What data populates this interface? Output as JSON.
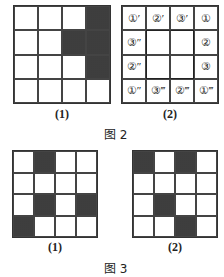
{
  "figure2": {
    "label": "图 2",
    "grid1": {
      "caption": "(1)",
      "rows": 4,
      "cols": 4,
      "shaded": [
        [
          0,
          3
        ],
        [
          1,
          2
        ],
        [
          1,
          3
        ],
        [
          2,
          3
        ]
      ]
    },
    "grid2": {
      "caption": "(2)",
      "cells": [
        [
          "①′",
          "②′",
          "③′",
          "①"
        ],
        [
          "③″",
          "",
          "",
          "②"
        ],
        [
          "②″",
          "",
          "",
          "③"
        ],
        [
          "①″",
          "③‴",
          "②‴",
          "①‴"
        ]
      ]
    }
  },
  "figure3": {
    "label": "图 3",
    "grid1": {
      "caption": "(1)",
      "rows": 4,
      "cols": 4,
      "shaded": [
        [
          0,
          1
        ],
        [
          2,
          1
        ],
        [
          2,
          3
        ],
        [
          3,
          0
        ]
      ]
    },
    "grid2": {
      "caption": "(2)",
      "rows": 4,
      "cols": 4,
      "shaded": [
        [
          0,
          0
        ],
        [
          0,
          2
        ],
        [
          2,
          1
        ],
        [
          3,
          2
        ]
      ]
    }
  }
}
